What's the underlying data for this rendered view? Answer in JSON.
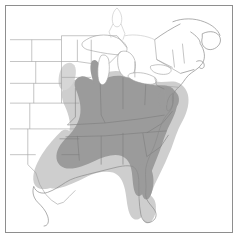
{
  "figure": {
    "type": "range-distribution-map",
    "title": "Distribution map of eastern United States",
    "region": "Eastern North America",
    "frame": {
      "visible": true,
      "border_color": "#8e8e8e",
      "background_color": "#ffffff"
    }
  },
  "legend": {
    "visible": false,
    "classes": [
      {
        "key": "core_range",
        "label": "Core range",
        "color": "#9b9b9b"
      },
      {
        "key": "peripheral_range",
        "label": "Peripheral range",
        "color": "#cfcfcf"
      },
      {
        "key": "absent",
        "label": "Absent",
        "color": "#ffffff"
      }
    ]
  },
  "styles": {
    "core_fill": "#9b9b9b",
    "peripheral_fill": "#cecece",
    "state_border": "#9d9d9d",
    "coastline": "#8a8a8a",
    "lake_fill": "#ffffff",
    "lake_border": "#9d9d9d",
    "canada_border": "#b4b4b4",
    "frame_border": "#8e8e8e"
  },
  "map_content": {
    "coastlines": [
      "Atlantic coast",
      "Gulf of Mexico coast",
      "Great Lakes shores"
    ],
    "features": [
      "Great Lakes",
      "Florida peninsula",
      "Cape Cod",
      "Long Island",
      "Chesapeake Bay",
      "Nova Scotia",
      "Gulf of St. Lawrence"
    ],
    "state_boundaries_visible": true,
    "labels_visible": false,
    "core_states": [
      "Missouri",
      "Illinois",
      "Indiana",
      "Ohio",
      "Kentucky",
      "Tennessee",
      "Arkansas",
      "Mississippi",
      "Alabama",
      "Georgia",
      "South Carolina",
      "North Carolina",
      "Virginia",
      "West Virginia",
      "Maryland",
      "Delaware",
      "Louisiana",
      "Florida"
    ],
    "peripheral_states": [
      "Texas",
      "Oklahoma",
      "Kansas",
      "Iowa",
      "Southern Florida"
    ],
    "unshaded_states": [
      "Montana",
      "North Dakota",
      "South Dakota",
      "Nebraska",
      "Minnesota",
      "Wisconsin",
      "Michigan",
      "New York",
      "Pennsylvania",
      "New Jersey",
      "Connecticut",
      "Rhode Island",
      "Massachusetts",
      "Vermont",
      "New Hampshire",
      "Maine"
    ]
  }
}
